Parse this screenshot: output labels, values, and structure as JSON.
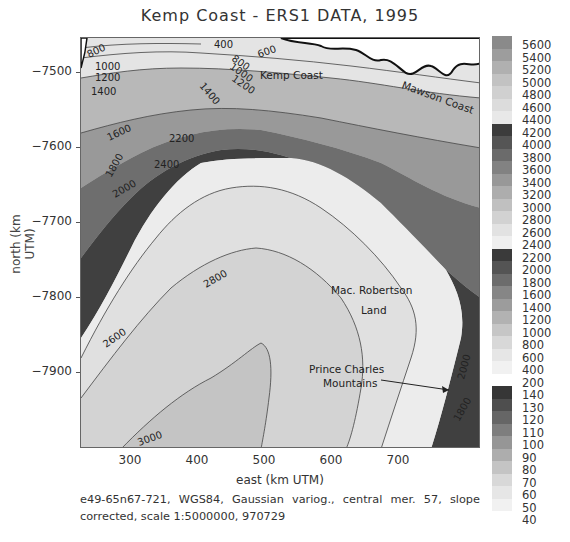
{
  "title": "Kemp Coast - ERS1 DATA, 1995",
  "axes": {
    "xlabel": "east (km UTM)",
    "ylabel": "north (km UTM)",
    "xticks": [
      {
        "label": "300",
        "x": 130
      },
      {
        "label": "400",
        "x": 197
      },
      {
        "label": "500",
        "x": 264
      },
      {
        "label": "600",
        "x": 331
      },
      {
        "label": "700",
        "x": 398
      }
    ],
    "yticks": [
      {
        "label": "-7500",
        "y": 72
      },
      {
        "label": "-7600",
        "y": 147
      },
      {
        "label": "-7700",
        "y": 222
      },
      {
        "label": "-7800",
        "y": 297
      },
      {
        "label": "-7900",
        "y": 372
      }
    ]
  },
  "caption": "e49-65n67-721, WGS84, Gaussian variog., central mer. 57, slope corrected, scale 1:5000000, 970729",
  "map_labels": {
    "kemp_coast": "Kemp Coast",
    "mawson_coast": "Mawson Coast",
    "mac_robertson_1": "Mac. Robertson",
    "mac_robertson_2": "Land",
    "prince_charles_1": "Prince Charles",
    "prince_charles_2": "Mountains"
  },
  "contour_labels": [
    "800",
    "1000",
    "1200",
    "1400",
    "1600",
    "1800",
    "2000",
    "2200",
    "2400",
    "2600",
    "2800",
    "3000",
    "400",
    "600",
    "800",
    "1000",
    "1200",
    "1400",
    "2000",
    "1800"
  ],
  "colorbar": {
    "labels": [
      "5600",
      "5400",
      "5200",
      "5000",
      "4800",
      "4600",
      "4400",
      "4200",
      "4000",
      "3800",
      "3600",
      "3400",
      "3200",
      "3000",
      "2800",
      "2600",
      "2400",
      "2200",
      "2000",
      "1800",
      "1600",
      "1400",
      "1200",
      "1000",
      "800",
      "600",
      "400",
      "200",
      "140",
      "130",
      "120",
      "110",
      "100",
      "90",
      "80",
      "70",
      "60",
      "50",
      "40"
    ],
    "colors": [
      "#8a8a8a",
      "#9d9d9d",
      "#b0b0b0",
      "#c2c2c2",
      "#d0d0d0",
      "#dcdcdc",
      "#e8e8e8",
      "#3c3c3c",
      "#555555",
      "#6b6b6b",
      "#828282",
      "#989898",
      "#adadad",
      "#c0c0c0",
      "#d2d2d2",
      "#e2e2e2",
      "#efefef",
      "#3a3a3a",
      "#545454",
      "#6c6c6c",
      "#868686",
      "#9c9c9c",
      "#b2b2b2",
      "#c6c6c6",
      "#d8d8d8",
      "#e6e6e6",
      "#f1f1f1",
      "#363636",
      "#4e4e4e",
      "#666666",
      "#7e7e7e",
      "#969696",
      "#adadad",
      "#c4c4c4",
      "#d8d8d8",
      "#e6e6e6",
      "#f1f1f1"
    ]
  },
  "chart_data": {
    "type": "heatmap",
    "title": "Kemp Coast - ERS1 DATA, 1995",
    "xlabel": "east (km UTM)",
    "ylabel": "north (km UTM)",
    "xlim": [
      225,
      775
    ],
    "ylim": [
      -8000,
      -7450
    ],
    "xticks": [
      300,
      400,
      500,
      600,
      700
    ],
    "yticks": [
      -7500,
      -7600,
      -7700,
      -7800,
      -7900
    ],
    "contour_levels_m": [
      200,
      400,
      600,
      800,
      1000,
      1200,
      1400,
      1600,
      1800,
      2000,
      2200,
      2400,
      2600,
      2800,
      3000
    ],
    "colorbar_levels": [
      5600,
      5400,
      5200,
      5000,
      4800,
      4600,
      4400,
      4200,
      4000,
      3800,
      3600,
      3400,
      3200,
      3000,
      2800,
      2600,
      2400,
      2200,
      2000,
      1800,
      1600,
      1400,
      1200,
      1000,
      800,
      600,
      400,
      200,
      140,
      130,
      120,
      110,
      100,
      90,
      80,
      70,
      60,
      50,
      40
    ],
    "annotations": [
      "Kemp Coast",
      "Mawson Coast",
      "Mac. Robertson Land",
      "Prince Charles Mountains"
    ],
    "caption": "e49-65n67-721, WGS84, Gaussian variog., central mer. 57, slope corrected, scale 1:5000000, 970729"
  }
}
